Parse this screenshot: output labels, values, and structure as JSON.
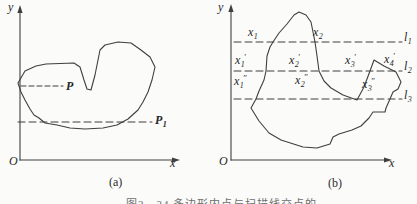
{
  "caption": {
    "text": "图2—34 多边形内点与扫描线交点的判别"
  },
  "panel_a": {
    "tag": "(a)",
    "y_axis_label": "y",
    "x_axis_label": "x",
    "origin_label": "O",
    "labels": {
      "p": {
        "base": "P"
      },
      "p1": {
        "base": "P",
        "sub": "1"
      }
    }
  },
  "panel_b": {
    "tag": "(b)",
    "y_axis_label": "y",
    "x_axis_label": "x",
    "origin_label": "O",
    "scanlines": [
      {
        "base": "l",
        "sub": "1"
      },
      {
        "base": "l",
        "sub": "2"
      },
      {
        "base": "l",
        "sub": "3"
      }
    ],
    "intersections": {
      "row1": [
        {
          "base": "x",
          "sub": "1"
        },
        {
          "base": "x",
          "sub": "2"
        }
      ],
      "row2": [
        {
          "base": "x",
          "sub": "1",
          "sup": "′"
        },
        {
          "base": "x",
          "sub": "2",
          "sup": "′"
        },
        {
          "base": "x",
          "sub": "3",
          "sup": "′"
        },
        {
          "base": "x",
          "sub": "4",
          "sup": "′"
        }
      ],
      "row3": [
        {
          "base": "x",
          "sub": "1",
          "sup": "″"
        },
        {
          "base": "x",
          "sub": "2",
          "sup": "″"
        },
        {
          "base": "x",
          "sub": "3",
          "sup": "″"
        }
      ]
    }
  },
  "colors": {
    "stroke": "#3f3f3f",
    "text": "#262626",
    "background": "#fbfbfa"
  }
}
